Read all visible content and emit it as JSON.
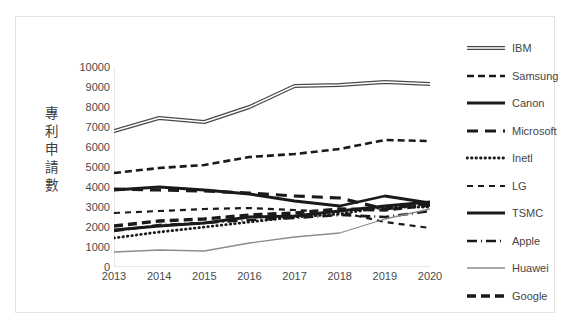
{
  "chart_data": {
    "type": "line",
    "title": "",
    "subtitle": "",
    "xlabel": "",
    "ylabel": "專利申請數",
    "categories": [
      "2013",
      "2014",
      "2015",
      "2016",
      "2017",
      "2018",
      "2019",
      "2020"
    ],
    "x": [
      2013,
      2014,
      2015,
      2016,
      2017,
      2018,
      2019,
      2020
    ],
    "ylim": [
      0,
      10000
    ],
    "xlim": [
      2013,
      2020
    ],
    "ytick_labels": [
      "0",
      "1000",
      "2000",
      "3000",
      "4000",
      "5000",
      "6000",
      "7000",
      "8000",
      "9000",
      "10000"
    ],
    "ytick_values": [
      0,
      1000,
      2000,
      3000,
      4000,
      5000,
      6000,
      7000,
      8000,
      9000,
      10000
    ],
    "ytick_step": 1000,
    "grid": false,
    "legend_position": "right",
    "series": [
      {
        "name": "IBM",
        "values": [
          6800,
          7450,
          7250,
          8000,
          9050,
          9100,
          9250,
          9150
        ],
        "style": "double-solid",
        "color": "#4a4a4a",
        "width": 2.4
      },
      {
        "name": "Samsung",
        "values": [
          4700,
          4950,
          5100,
          5500,
          5650,
          5900,
          6350,
          6300
        ],
        "style": "dashed",
        "color": "#1a1a1a",
        "width": 2.6
      },
      {
        "name": "Canon",
        "values": [
          3850,
          4000,
          3850,
          3650,
          3300,
          3050,
          3550,
          3200
        ],
        "style": "solid",
        "color": "#1a1a1a",
        "width": 2.8
      },
      {
        "name": "Microsoft",
        "values": [
          3900,
          3850,
          3800,
          3700,
          3550,
          3450,
          2900,
          3200
        ],
        "style": "long-dash",
        "color": "#1a1a1a",
        "width": 3.2
      },
      {
        "name": "Inetl",
        "values": [
          1450,
          1750,
          2000,
          2250,
          2500,
          2650,
          3000,
          3000
        ],
        "style": "dotted",
        "color": "#1a1a1a",
        "width": 2.8
      },
      {
        "name": "LG",
        "values": [
          2700,
          2800,
          2900,
          2950,
          2850,
          2750,
          2250,
          1950
        ],
        "style": "dashed-thin",
        "color": "#1a1a1a",
        "width": 2.2
      },
      {
        "name": "TSMC",
        "values": [
          1850,
          2050,
          2200,
          2500,
          2550,
          2800,
          3050,
          3250
        ],
        "style": "solid-thick",
        "color": "#1a1a1a",
        "width": 3.0
      },
      {
        "name": "Apple",
        "values": [
          1800,
          2100,
          2200,
          2350,
          2450,
          2600,
          2500,
          2800
        ],
        "style": "dash-dot",
        "color": "#1a1a1a",
        "width": 2.6
      },
      {
        "name": "Huawei",
        "values": [
          750,
          850,
          800,
          1200,
          1500,
          1700,
          2400,
          2900
        ],
        "style": "thin-gray",
        "color": "#8c8c8c",
        "width": 1.3
      },
      {
        "name": "Google",
        "values": [
          2050,
          2300,
          2400,
          2600,
          2700,
          2900,
          2850,
          3100
        ],
        "style": "bold-dash",
        "color": "#1a1a1a",
        "width": 3.4
      }
    ]
  }
}
